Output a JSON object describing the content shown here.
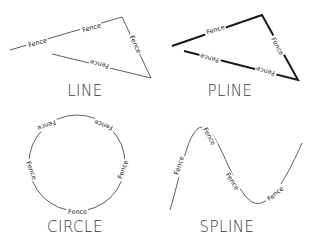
{
  "panels": [
    {
      "id": "line",
      "title": "LINE",
      "fence_label": "Fence"
    },
    {
      "id": "pline",
      "title": "PLINE",
      "fence_label": "Fence"
    },
    {
      "id": "circle",
      "title": "CIRCLE",
      "fence_label": "Fence"
    },
    {
      "id": "spline",
      "title": "SPLINE",
      "fence_label": "Fence"
    }
  ],
  "colors": {
    "line": "#333333",
    "pline": "#1a1a1a",
    "text": "#3a3a3a",
    "background": "#ffffff"
  }
}
